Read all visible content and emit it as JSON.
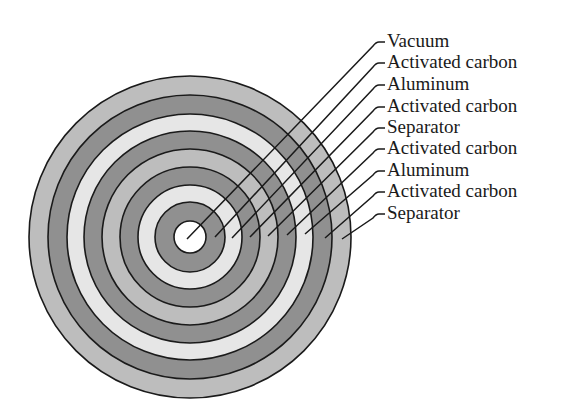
{
  "diagram": {
    "center": [
      190,
      237
    ],
    "rings": [
      {
        "name": "Separator",
        "outer_r": 161,
        "color": "#bdbdbd"
      },
      {
        "name": "Activated carbon",
        "outer_r": 142,
        "color": "#909090"
      },
      {
        "name": "Aluminum",
        "outer_r": 123,
        "color": "#e6e6e6"
      },
      {
        "name": "Activated carbon",
        "outer_r": 106,
        "color": "#909090"
      },
      {
        "name": "Separator",
        "outer_r": 88,
        "color": "#bdbdbd"
      },
      {
        "name": "Activated carbon",
        "outer_r": 70,
        "color": "#909090"
      },
      {
        "name": "Aluminum",
        "outer_r": 52,
        "color": "#e6e6e6"
      },
      {
        "name": "Activated carbon",
        "outer_r": 35,
        "color": "#909090"
      },
      {
        "name": "Vacuum",
        "outer_r": 16,
        "color": "#ffffff"
      }
    ],
    "labels": [
      {
        "text": "Vacuum",
        "y": 41,
        "end": [
          187,
          239
        ]
      },
      {
        "text": "Activated carbon",
        "y": 62,
        "end": [
          215,
          237
        ]
      },
      {
        "text": "Aluminum",
        "y": 84,
        "end": [
          232,
          238
        ]
      },
      {
        "text": "Activated carbon",
        "y": 106,
        "end": [
          250,
          237
        ]
      },
      {
        "text": "Separator",
        "y": 127,
        "end": [
          268,
          236
        ]
      },
      {
        "text": "Activated carbon",
        "y": 148,
        "end": [
          287,
          235
        ]
      },
      {
        "text": "Aluminum",
        "y": 170,
        "end": [
          305,
          234
        ]
      },
      {
        "text": "Activated carbon",
        "y": 191,
        "end": [
          325,
          238
        ]
      },
      {
        "text": "Separator",
        "y": 213,
        "end": [
          342,
          239
        ]
      }
    ],
    "stroke_color": "#1a1a1a"
  }
}
